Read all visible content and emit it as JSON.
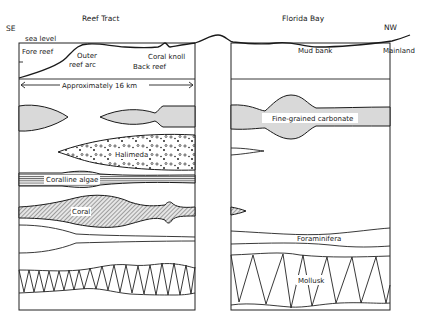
{
  "diagram": {
    "left_panel": {
      "title": "Reef Tract",
      "direction": "SE",
      "sea_level_label": "sea level",
      "profile_labels": {
        "fore_reef": "Fore reef",
        "outer_reef_arc_line1": "Outer",
        "outer_reef_arc_line2": "reef arc",
        "coral_knoll": "Coral knoll",
        "back_reef": "Back reef"
      },
      "scale_label": "Approximately 16 km"
    },
    "right_panel": {
      "title": "Florida Bay",
      "direction": "NW",
      "profile_labels": {
        "mud_bank": "Mud bank",
        "mainland": "Mainland"
      }
    },
    "facies": [
      {
        "name": "Fine-grained carbonate",
        "pattern": "gray-fill",
        "panels": [
          "Reef Tract",
          "Florida Bay"
        ]
      },
      {
        "name": "Halimeda",
        "pattern": "dots",
        "panels": [
          "Reef Tract",
          "Florida Bay"
        ]
      },
      {
        "name": "Coralline algae",
        "pattern": "horizontal-stripes",
        "panels": [
          "Reef Tract"
        ]
      },
      {
        "name": "Coral",
        "pattern": "diagonal-hatch",
        "panels": [
          "Reef Tract",
          "Florida Bay"
        ]
      },
      {
        "name": "Foraminifera",
        "pattern": "open",
        "panels": [
          "Reef Tract",
          "Florida Bay"
        ]
      },
      {
        "name": "Mollusk",
        "pattern": "zigzag",
        "panels": [
          "Reef Tract",
          "Florida Bay"
        ]
      }
    ],
    "labels": {
      "fine_grained_carbonate": "Fine-grained carbonate",
      "halimeda": "Halimeda",
      "coralline_algae": "Coralline algae",
      "coral": "Coral",
      "foraminifera": "Foraminifera",
      "mollusk": "Mollusk"
    },
    "colors": {
      "line": "#1a1a1a",
      "gray_fill": "#d9d9d9",
      "background": "#ffffff"
    }
  }
}
